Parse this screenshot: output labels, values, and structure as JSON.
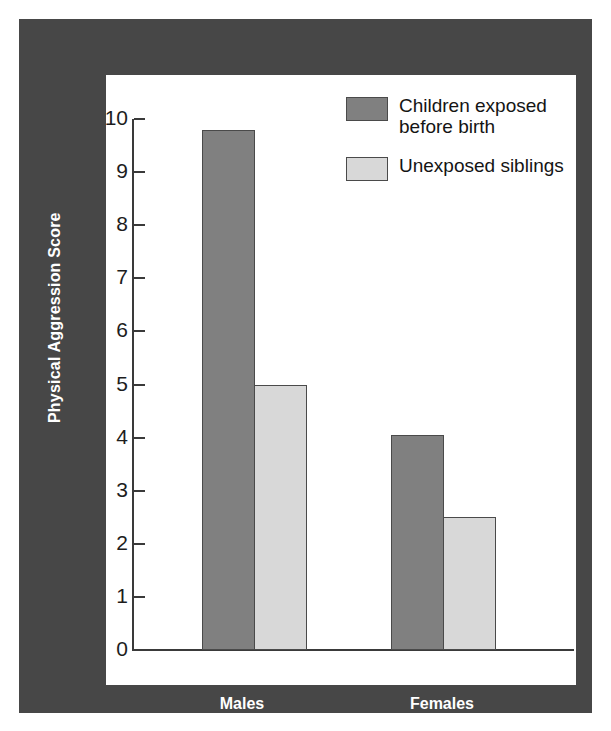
{
  "chart_data": {
    "type": "bar",
    "title": "",
    "xlabel": "",
    "ylabel": "Physical Aggression Score",
    "categories": [
      "Males",
      "Females"
    ],
    "series": [
      {
        "name": "Children exposed before birth",
        "values": [
          9.8,
          4.05
        ],
        "color": "#808080"
      },
      {
        "name": "Unexposed siblings",
        "values": [
          5.0,
          2.5
        ],
        "color": "#d8d8d8"
      }
    ],
    "ylim": [
      0,
      10
    ],
    "yticks": [
      "0",
      "1",
      "2",
      "3",
      "4",
      "5",
      "6",
      "7",
      "8",
      "9",
      "10"
    ],
    "grid": false,
    "legend_position": "top-right"
  },
  "legend": {
    "items": [
      {
        "label": "Children exposed\nbefore birth",
        "swatch": "dark"
      },
      {
        "label": "Unexposed siblings",
        "swatch": "light"
      }
    ]
  },
  "axis": {
    "y_title": "Physical Aggression Score",
    "tick_labels": [
      "10",
      "9",
      "8",
      "7",
      "6",
      "5",
      "4",
      "3",
      "2",
      "1",
      "0"
    ]
  },
  "x_categories": [
    {
      "label": "Males"
    },
    {
      "label": "Females"
    }
  ],
  "colors": {
    "frame": "#474747",
    "panel": "#ffffff",
    "bar_dark": "#808080",
    "bar_light": "#d8d8d8",
    "axis": "#3a3a3a",
    "label_text": "#ffffff"
  }
}
